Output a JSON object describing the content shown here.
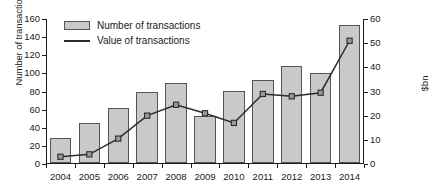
{
  "chart_data": {
    "type": "bar",
    "title": "",
    "xlabel": "",
    "ylabel": "Number of transactions",
    "y2label": "$bn",
    "categories": [
      "2004",
      "2005",
      "2006",
      "2007",
      "2008",
      "2009",
      "2010",
      "2011",
      "2012",
      "2013",
      "2014"
    ],
    "ylim": [
      0,
      160
    ],
    "y2lim": [
      0,
      60
    ],
    "yticks": [
      0,
      20,
      40,
      60,
      80,
      100,
      120,
      140,
      160
    ],
    "y2ticks": [
      0,
      10,
      20,
      30,
      40,
      50,
      60
    ],
    "grid": false,
    "legend_position": "top-left",
    "series": [
      {
        "name": "Number of transactions",
        "type": "bar",
        "axis": "left",
        "color": "#c9c9c9",
        "edge_color": "#555555",
        "values": [
          28,
          44,
          61,
          78,
          88,
          52,
          79,
          92,
          107,
          99,
          152
        ]
      },
      {
        "name": "Value of transactions",
        "type": "line",
        "axis": "right",
        "color": "#2b2b2b",
        "marker": "square",
        "values": [
          3,
          4,
          10.5,
          20,
          24.5,
          21,
          17,
          29,
          28,
          29.5,
          51
        ]
      }
    ]
  },
  "legend": {
    "items": [
      {
        "label": "Number of transactions",
        "marker": "bar-swatch"
      },
      {
        "label": "Value of transactions",
        "marker": "line-swatch"
      }
    ]
  },
  "axes": {
    "left_title": "Number of transactions",
    "right_title": "$bn"
  }
}
